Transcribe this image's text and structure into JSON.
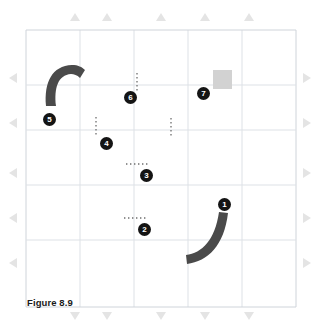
{
  "figure": {
    "caption": "Figure 8.9",
    "canvas": {
      "width": 317,
      "height": 331,
      "background": "#ffffff"
    },
    "grid": {
      "x0": 26,
      "y0": 30,
      "x1": 296,
      "y1": 307,
      "columns": 5,
      "rows": 5,
      "line_color": "#d9dde3",
      "border_color": "#cfd4da",
      "visible": true
    },
    "colors": {
      "arc_fill": "#4a4a4a",
      "square_fill": "#d2d2d2",
      "marker_fill": "#141414",
      "marker_text": "#ffffff",
      "dotted": "#6e6e6e",
      "edge_arrow": "#e4e4e4",
      "caption_text": "#1a1a1a"
    },
    "edge_arrows": {
      "top": {
        "direction": "up",
        "count": 5,
        "label": "top-edge-arrows"
      },
      "bottom": {
        "direction": "down",
        "count": 5,
        "label": "bottom-edge-arrows"
      },
      "left": {
        "direction": "left",
        "count": 5,
        "label": "left-edge-arrows"
      },
      "right": {
        "direction": "right",
        "count": 5,
        "label": "right-edge-arrows"
      }
    },
    "markers": [
      {
        "id": 1,
        "label": "1",
        "x": 224,
        "y": 204,
        "feature": "curved-arc"
      },
      {
        "id": 2,
        "label": "2",
        "x": 144,
        "y": 229,
        "feature": "horizontal-dotted-line"
      },
      {
        "id": 3,
        "label": "3",
        "x": 146,
        "y": 175,
        "feature": "horizontal-dotted-line"
      },
      {
        "id": 4,
        "label": "4",
        "x": 106,
        "y": 143,
        "feature": "vertical-dotted-line"
      },
      {
        "id": 5,
        "label": "5",
        "x": 49,
        "y": 119,
        "feature": "curved-arc"
      },
      {
        "id": 6,
        "label": "6",
        "x": 130,
        "y": 97,
        "feature": "vertical-dotted-line"
      },
      {
        "id": 7,
        "label": "7",
        "x": 203,
        "y": 93,
        "feature": "gray-square"
      }
    ],
    "shapes": [
      {
        "name": "arc-lower-right",
        "type": "arc",
        "description": "thick charcoal arc curving from lower-left to upper-right",
        "marker": 1
      },
      {
        "name": "arc-upper-left",
        "type": "arc",
        "description": "thick charcoal arc curving from lower-left up and over to the right",
        "marker": 5
      },
      {
        "name": "gray-square",
        "type": "square",
        "x": 213,
        "y": 70,
        "width": 19,
        "height": 19,
        "marker": 7
      }
    ],
    "dotted_lines": [
      {
        "name": "dotted-vertical-6",
        "orientation": "vertical",
        "x": 137,
        "y1": 73,
        "y2": 93,
        "marker": 6
      },
      {
        "name": "dotted-vertical-4",
        "orientation": "vertical",
        "x": 96,
        "y1": 117,
        "y2": 137,
        "marker": 4
      },
      {
        "name": "dotted-vertical-unlabeled",
        "orientation": "vertical",
        "x": 171,
        "y1": 118,
        "y2": 136,
        "marker": null
      },
      {
        "name": "dotted-horizontal-3",
        "orientation": "horizontal",
        "y": 164,
        "x1": 126,
        "x2": 146,
        "marker": 3
      },
      {
        "name": "dotted-horizontal-2",
        "orientation": "horizontal",
        "y": 218,
        "x1": 124,
        "x2": 144,
        "marker": 2
      }
    ]
  }
}
